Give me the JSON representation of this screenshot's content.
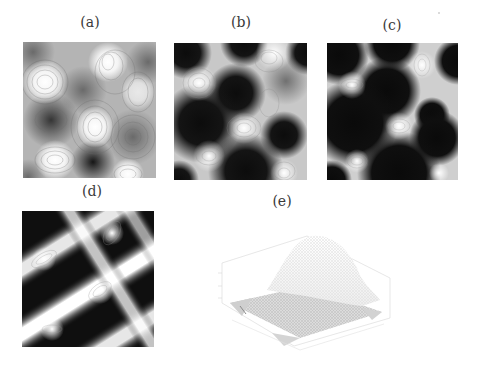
{
  "figure": {
    "panels": [
      {
        "id": "a",
        "label": "(a)",
        "kind": "contour-density-map",
        "contrast": "low"
      },
      {
        "id": "b",
        "label": "(b)",
        "kind": "contour-density-map",
        "contrast": "medium"
      },
      {
        "id": "c",
        "label": "(c)",
        "kind": "contour-density-map",
        "contrast": "high"
      },
      {
        "id": "d",
        "label": "(d)",
        "kind": "contour-density-map",
        "contrast": "high, stripe pattern"
      },
      {
        "id": "e",
        "label": "(e)",
        "kind": "3d-surface-mesh"
      }
    ]
  },
  "colors": {
    "background": "#ffffff",
    "dark": "#111111",
    "light": "#ffffff",
    "mid": "#9a9a9a",
    "mesh": "#c8c8c8"
  }
}
